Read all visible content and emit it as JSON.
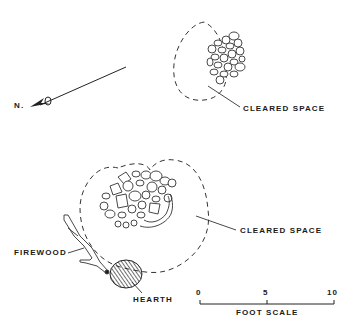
{
  "diagram": {
    "north_arrow": {
      "label": "N.",
      "icon": "north-arrow-icon"
    },
    "upper_feature": {
      "callout_label": "CLEARED SPACE",
      "elements": [
        "rock-cluster",
        "cleared-space-outline"
      ]
    },
    "lower_feature": {
      "callout_label": "CLEARED SPACE",
      "elements": [
        "rock-cluster",
        "cleared-space-outline",
        "firewood",
        "hearth"
      ]
    },
    "firewood_label": "FIREWOOD",
    "hearth_label": "HEARTH",
    "scale_bar": {
      "ticks": [
        "0",
        "5",
        "10"
      ],
      "title": "FOOT SCALE"
    }
  }
}
